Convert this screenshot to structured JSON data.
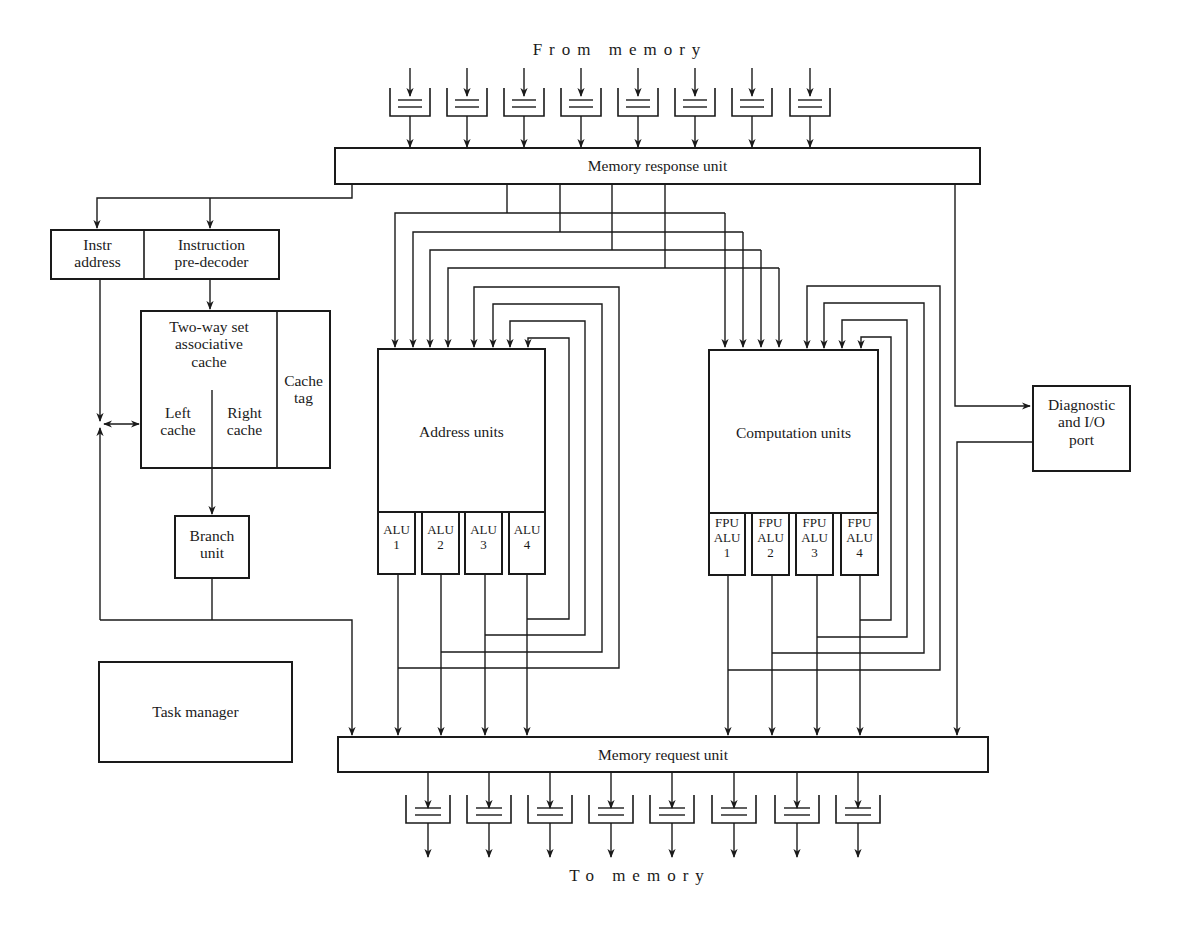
{
  "title_top": "From memory",
  "title_bottom": "To memory",
  "memory_response_unit": {
    "label": "Memory response unit"
  },
  "memory_request_unit": {
    "label": "Memory request unit"
  },
  "instr_address": {
    "line1": "Instr",
    "line2": "address"
  },
  "instruction_predecoder": {
    "line1": "Instruction",
    "line2": "pre-decoder"
  },
  "cache": {
    "title_line1": "Two-way set",
    "title_line2": "associative",
    "title_line3": "cache",
    "left_line1": "Left",
    "left_line2": "cache",
    "right_line1": "Right",
    "right_line2": "cache",
    "tag_line1": "Cache",
    "tag_line2": "tag"
  },
  "branch_unit": {
    "line1": "Branch",
    "line2": "unit"
  },
  "task_manager": {
    "label": "Task manager"
  },
  "address_units": {
    "label": "Address units",
    "alus": [
      {
        "line1": "ALU",
        "line2": "1"
      },
      {
        "line1": "ALU",
        "line2": "2"
      },
      {
        "line1": "ALU",
        "line2": "3"
      },
      {
        "line1": "ALU",
        "line2": "4"
      }
    ]
  },
  "computation_units": {
    "label": "Computation units",
    "fpus": [
      {
        "line1": "FPU",
        "line2": "ALU",
        "line3": "1"
      },
      {
        "line1": "FPU",
        "line2": "ALU",
        "line3": "2"
      },
      {
        "line1": "FPU",
        "line2": "ALU",
        "line3": "3"
      },
      {
        "line1": "FPU",
        "line2": "ALU",
        "line3": "4"
      }
    ]
  },
  "diagnostic_port": {
    "line1": "Diagnostic",
    "line2": "and I/O",
    "line3": "port"
  },
  "input_queue_count": 8,
  "output_queue_count": 8
}
